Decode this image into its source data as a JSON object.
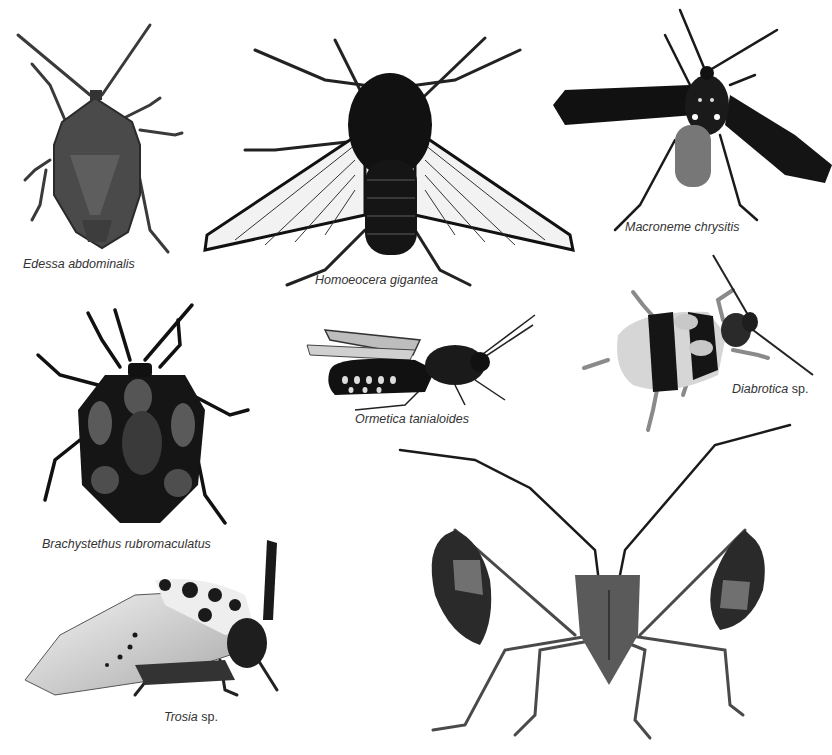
{
  "plate": {
    "background": "#ffffff",
    "caption_color": "#333333",
    "specimens": [
      {
        "id": "edessa",
        "caption": "Edessa abdominalis",
        "genus": "Edessa abdominalis",
        "qualifier": "",
        "type": "stink bug, dorsal view"
      },
      {
        "id": "homoeocera",
        "caption": "Homoeocera gigantea",
        "genus": "Homoeocera gigantea",
        "qualifier": "",
        "type": "clearwing moth, dorsal view"
      },
      {
        "id": "macroneme",
        "caption": "Macroneme chrysitis",
        "genus": "Macroneme chrysitis",
        "qualifier": "",
        "type": "wasp moth, dorsal view"
      },
      {
        "id": "brachystethus",
        "caption": "Brachystethus rubromaculatus",
        "genus": "Brachystethus rubromaculatus",
        "qualifier": "",
        "type": "stink bug with red spots, dorsal view"
      },
      {
        "id": "ormetica",
        "caption": "Ormetica tanialoides",
        "genus": "Ormetica tanialoides",
        "qualifier": "",
        "type": "tiger moth, lateral view"
      },
      {
        "id": "diabrotica",
        "caption": "Diabrotica sp.",
        "genus": "Diabrotica",
        "qualifier": "sp.",
        "type": "leaf beetle, dorsal view"
      },
      {
        "id": "trosia",
        "caption": "Trosia sp.",
        "genus": "Trosia",
        "qualifier": "sp.",
        "type": "flannel moth, lateral view"
      },
      {
        "id": "leaf-footed-bug",
        "caption": "",
        "genus": "",
        "qualifier": "",
        "type": "leaf-footed bug, frontal view"
      }
    ]
  }
}
